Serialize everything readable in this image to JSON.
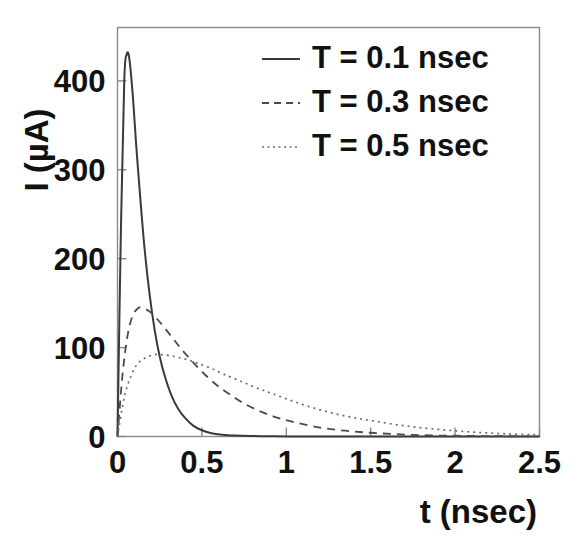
{
  "chart_data": {
    "type": "line",
    "title": "",
    "xlabel": "t (nsec)",
    "ylabel": "I (µA)",
    "xlim": [
      0,
      2.5
    ],
    "ylim": [
      0,
      460
    ],
    "grid": false,
    "legend_position": "top-right",
    "xticks": [
      0,
      0.5,
      1,
      1.5,
      2,
      2.5
    ],
    "xticklabels": [
      "0",
      "0.5",
      "1",
      "1.5",
      "2",
      "2.5"
    ],
    "yticks": [
      0,
      100,
      200,
      300,
      400
    ],
    "yticklabels": [
      "0",
      "100",
      "200",
      "300",
      "400"
    ],
    "series": [
      {
        "name": "T = 0.1 nsec",
        "style": "solid",
        "color": "#3a3a3a",
        "peak_x": 0.06,
        "peak_y": 430,
        "x": [
          0.0,
          0.02,
          0.04,
          0.055,
          0.07,
          0.09,
          0.11,
          0.13,
          0.16,
          0.19,
          0.22,
          0.25,
          0.28,
          0.32,
          0.36,
          0.4,
          0.45,
          0.5,
          0.55,
          0.62,
          0.7,
          0.8,
          0.9,
          1.0,
          1.2,
          1.5,
          2.0,
          2.5
        ],
        "y": [
          0,
          230,
          400,
          430,
          425,
          385,
          330,
          280,
          212,
          160,
          120,
          90,
          68,
          46,
          31,
          21,
          12,
          7,
          4,
          2,
          1,
          0.5,
          0.2,
          0.1,
          0,
          0,
          0,
          0
        ]
      },
      {
        "name": "T = 0.3 nsec",
        "style": "dashed",
        "color": "#4a4a4a",
        "peak_x": 0.14,
        "peak_y": 145,
        "x": [
          0.0,
          0.03,
          0.06,
          0.09,
          0.12,
          0.14,
          0.17,
          0.2,
          0.24,
          0.28,
          0.33,
          0.38,
          0.44,
          0.5,
          0.58,
          0.66,
          0.75,
          0.85,
          0.95,
          1.05,
          1.2,
          1.35,
          1.5,
          1.7,
          1.9,
          2.1,
          2.3,
          2.5
        ],
        "y": [
          0,
          70,
          114,
          136,
          144,
          145,
          143,
          139,
          131,
          122,
          110,
          98,
          85,
          73,
          59,
          48,
          37,
          28,
          21,
          16,
          10,
          6.5,
          4.2,
          2.2,
          1.1,
          0.6,
          0.3,
          0.1
        ]
      },
      {
        "name": "T = 0.5 nsec",
        "style": "dotted",
        "color": "#6e6e6e",
        "peak_x": 0.26,
        "peak_y": 92,
        "x": [
          0.0,
          0.04,
          0.08,
          0.12,
          0.17,
          0.22,
          0.26,
          0.31,
          0.36,
          0.42,
          0.48,
          0.55,
          0.63,
          0.72,
          0.82,
          0.92,
          1.05,
          1.2,
          1.35,
          1.5,
          1.7,
          1.9,
          2.1,
          2.3,
          2.5
        ],
        "y": [
          0,
          44,
          68,
          82,
          89,
          92,
          92,
          91,
          89,
          86,
          82,
          77,
          70,
          63,
          55,
          48,
          39,
          30,
          23,
          18,
          12,
          8,
          5,
          3,
          1.8
        ]
      }
    ]
  },
  "legend": {
    "items": [
      {
        "label": "T = 0.1 nsec",
        "style": "solid"
      },
      {
        "label": "T = 0.3 nsec",
        "style": "dashed"
      },
      {
        "label": "T = 0.5 nsec",
        "style": "dotted"
      }
    ]
  }
}
